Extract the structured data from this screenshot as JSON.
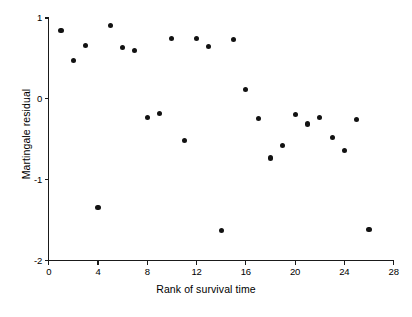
{
  "chart_data": {
    "type": "scatter",
    "title": "",
    "xlabel": "Rank of survival time",
    "ylabel": "Martingale residual",
    "xlim": [
      0,
      28
    ],
    "ylim": [
      -2,
      1
    ],
    "grid": false,
    "legend": null,
    "xticks": [
      0,
      4,
      8,
      12,
      16,
      20,
      24,
      28
    ],
    "xtick_labels": [
      "0",
      "4",
      "8",
      "12",
      "16",
      "20",
      "24",
      "28"
    ],
    "yticks": [
      1,
      0,
      -1,
      -2
    ],
    "ytick_labels": [
      "1",
      "0",
      "-1",
      "-2"
    ],
    "marker": "filled-circle",
    "marker_color": "#121212",
    "axis_color": "#1a1a1a",
    "background_color": "#ffffff",
    "x": [
      1,
      2,
      3,
      4,
      5,
      6,
      7,
      8,
      9,
      10,
      11,
      12,
      13,
      14,
      15,
      16,
      17,
      18,
      19,
      20,
      21,
      22,
      23,
      24,
      25,
      26
    ],
    "y": [
      0.84,
      0.48,
      0.66,
      -1.34,
      0.91,
      0.64,
      0.6,
      -0.23,
      -0.18,
      0.75,
      -0.51,
      0.75,
      0.65,
      -1.63,
      0.73,
      0.12,
      -0.24,
      -0.73,
      -0.58,
      -0.19,
      -0.31,
      -0.23,
      -0.48,
      -0.64,
      -0.25,
      -1.61
    ],
    "points": [
      {
        "x": 1,
        "y": 0.84
      },
      {
        "x": 2,
        "y": 0.48
      },
      {
        "x": 3,
        "y": 0.66
      },
      {
        "x": 4,
        "y": -1.34
      },
      {
        "x": 5,
        "y": 0.91
      },
      {
        "x": 6,
        "y": 0.64
      },
      {
        "x": 7,
        "y": 0.6
      },
      {
        "x": 8,
        "y": -0.23
      },
      {
        "x": 9,
        "y": -0.18
      },
      {
        "x": 10,
        "y": 0.75
      },
      {
        "x": 11,
        "y": -0.51
      },
      {
        "x": 12,
        "y": 0.75
      },
      {
        "x": 13,
        "y": 0.65
      },
      {
        "x": 14,
        "y": -1.63
      },
      {
        "x": 15,
        "y": 0.73
      },
      {
        "x": 16,
        "y": 0.12
      },
      {
        "x": 17,
        "y": -0.24
      },
      {
        "x": 18,
        "y": -0.73
      },
      {
        "x": 19,
        "y": -0.58
      },
      {
        "x": 20,
        "y": -0.19
      },
      {
        "x": 21,
        "y": -0.31
      },
      {
        "x": 22,
        "y": -0.23
      },
      {
        "x": 23,
        "y": -0.48
      },
      {
        "x": 24,
        "y": -0.64
      },
      {
        "x": 25,
        "y": -0.25
      },
      {
        "x": 26,
        "y": -1.61
      }
    ]
  }
}
